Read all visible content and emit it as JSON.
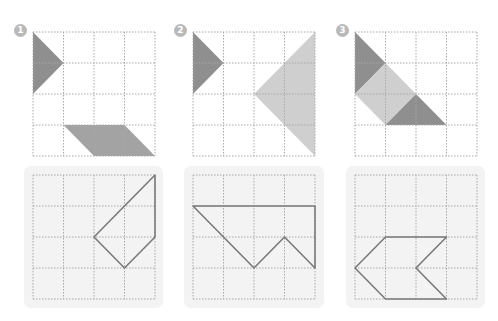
{
  "diagram": {
    "grid_size": 4,
    "cell_px": 31,
    "colors": {
      "grid_line": "#a8a8a8",
      "dark_shape": "#8f8f8f",
      "medium_shape": "#a3a3a3",
      "light_shape": "#cfcfcf",
      "outline": "#7a7a7a",
      "badge": "#b9b9b9",
      "panel_bg": "#f3f3f3"
    },
    "problems": [
      {
        "number": "1",
        "top_shapes": [
          {
            "tone": "dark",
            "points": [
              [
                0,
                0
              ],
              [
                1,
                1
              ],
              [
                0,
                2
              ]
            ]
          },
          {
            "tone": "medium",
            "points": [
              [
                1,
                3
              ],
              [
                3,
                3
              ],
              [
                4,
                4
              ],
              [
                2,
                4
              ]
            ]
          }
        ],
        "target_outline": [
          [
            4,
            0
          ],
          [
            4,
            2
          ],
          [
            3,
            3
          ],
          [
            2,
            2
          ]
        ]
      },
      {
        "number": "2",
        "top_shapes": [
          {
            "tone": "dark",
            "points": [
              [
                0,
                0
              ],
              [
                1,
                1
              ],
              [
                0,
                2
              ]
            ]
          },
          {
            "tone": "light",
            "points": [
              [
                4,
                0
              ],
              [
                2,
                2
              ],
              [
                4,
                4
              ]
            ]
          }
        ],
        "target_outline": [
          [
            0,
            1
          ],
          [
            4,
            1
          ],
          [
            4,
            3
          ],
          [
            3,
            2
          ],
          [
            2,
            3
          ]
        ]
      },
      {
        "number": "3",
        "top_shapes": [
          {
            "tone": "dark",
            "points": [
              [
                0,
                0
              ],
              [
                1,
                1
              ],
              [
                0,
                2
              ]
            ]
          },
          {
            "tone": "light",
            "points": [
              [
                1,
                1
              ],
              [
                2,
                2
              ],
              [
                1,
                3
              ],
              [
                0,
                2
              ]
            ]
          },
          {
            "tone": "dark",
            "points": [
              [
                2,
                2
              ],
              [
                3,
                3
              ],
              [
                1,
                3
              ]
            ]
          }
        ],
        "target_outline": [
          [
            1,
            2
          ],
          [
            3,
            2
          ],
          [
            2,
            3
          ],
          [
            3,
            4
          ],
          [
            1,
            4
          ],
          [
            0,
            3
          ]
        ]
      }
    ]
  }
}
